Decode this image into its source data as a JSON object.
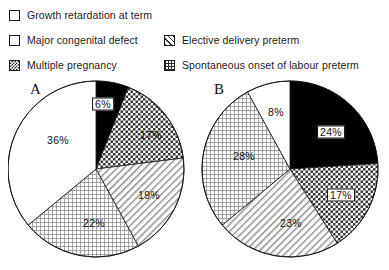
{
  "legend": {
    "items": [
      {
        "label": "Growth retardation at term",
        "pattern": "blank",
        "swatch_name": "swatch-blank",
        "column": "left",
        "row": 1
      },
      {
        "label": "Major congenital defect",
        "pattern": "solid",
        "swatch_name": "swatch-solid",
        "column": "left",
        "row": 2
      },
      {
        "label": "Multiple pregnancy",
        "pattern": "checker",
        "swatch_name": "swatch-checker",
        "column": "left",
        "row": 3
      },
      {
        "label": "Elective delivery preterm",
        "pattern": "diag",
        "swatch_name": "swatch-diag",
        "column": "right",
        "row": 2
      },
      {
        "label": "Spontaneous onset of labour preterm",
        "pattern": "grid",
        "swatch_name": "swatch-grid",
        "column": "right",
        "row": 3
      }
    ]
  },
  "charts": {
    "a": {
      "panel_letter": "A",
      "labels": [
        {
          "text": "6%",
          "x": 95,
          "y": 26,
          "boxed": true
        },
        {
          "text": "17%",
          "x": 143,
          "y": 57,
          "boxed": false
        },
        {
          "text": "19%",
          "x": 141,
          "y": 117,
          "boxed": false
        },
        {
          "text": "22%",
          "x": 86,
          "y": 145,
          "boxed": false
        },
        {
          "text": "36%",
          "x": 50,
          "y": 62,
          "boxed": false
        }
      ]
    },
    "b": {
      "panel_letter": "B",
      "labels": [
        {
          "text": "24%",
          "x": 133,
          "y": 54,
          "boxed": true
        },
        {
          "text": "17%",
          "x": 143,
          "y": 117,
          "boxed": true
        },
        {
          "text": "23%",
          "x": 93,
          "y": 145,
          "boxed": false
        },
        {
          "text": "28%",
          "x": 46,
          "y": 78,
          "boxed": false
        },
        {
          "text": "8%",
          "x": 78,
          "y": 34,
          "boxed": false
        }
      ]
    }
  },
  "chart_data": [
    {
      "type": "pie",
      "title": "A",
      "categories": [
        "Major congenital defect",
        "Multiple pregnancy",
        "Elective delivery preterm",
        "Spontaneous onset of labour preterm",
        "Growth retardation at term"
      ],
      "values": [
        6,
        17,
        19,
        22,
        36
      ],
      "value_labels": [
        "6%",
        "17%",
        "19%",
        "22%",
        "36%"
      ],
      "patterns": [
        "solid",
        "checker",
        "diag",
        "grid",
        "blank"
      ],
      "start_angle_deg": 0,
      "direction": "clockwise",
      "units": "percent",
      "legend_position": "top"
    },
    {
      "type": "pie",
      "title": "B",
      "categories": [
        "Major congenital defect",
        "Multiple pregnancy",
        "Elective delivery preterm",
        "Spontaneous onset of labour preterm",
        "Growth retardation at term"
      ],
      "values": [
        24,
        17,
        23,
        28,
        8
      ],
      "value_labels": [
        "24%",
        "17%",
        "23%",
        "28%",
        "8%"
      ],
      "patterns": [
        "solid",
        "checker",
        "diag",
        "grid",
        "blank"
      ],
      "start_angle_deg": 0,
      "direction": "clockwise",
      "units": "percent",
      "legend_position": "top"
    }
  ]
}
